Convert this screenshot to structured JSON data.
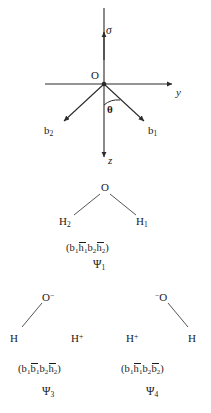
{
  "figure": {
    "title_text": "",
    "stroke_color": "#2b2b2b",
    "text_color": "#1a1a1a",
    "background": "#ffffff"
  },
  "axes_diagram": {
    "origin_label": "O",
    "sigma_label": "σ",
    "y_axis_label": "y",
    "z_axis_label": "z",
    "theta_label": "θ",
    "bond_left_label": "b",
    "bond_left_sub": "2",
    "bond_right_label": "b",
    "bond_right_sub": "1"
  },
  "structure_top": {
    "oxygen_label": "O",
    "h_left_label": "H",
    "h_left_sub": "2",
    "h_right_label": "H",
    "h_right_sub": "1",
    "formula": {
      "open": "(",
      "t1": "b",
      "t1sub": "1",
      "t2": "h",
      "t2sub": "1",
      "t2bar": true,
      "t3": "b",
      "t3sub": "2",
      "t4": "h",
      "t4sub": "2",
      "t4bar": true,
      "close": ")"
    },
    "psi": "Ψ",
    "psi_sub": "1"
  },
  "structure_left": {
    "oxygen_label": "O",
    "oxygen_charge": "−",
    "h_left_label": "H",
    "h_right_label": "H",
    "h_right_charge": "+",
    "formula": {
      "open": "(",
      "t1": "b",
      "t1sub": "1",
      "t2": "b",
      "t2sub": "1",
      "t2bar": true,
      "t3": "b",
      "t3sub": "2",
      "t4": "h",
      "t4sub": "2",
      "t4bar": true,
      "close": ")"
    },
    "psi": "Ψ",
    "psi_sub": "3"
  },
  "structure_right": {
    "oxygen_label": "O",
    "oxygen_charge": "−",
    "h_left_label": "H",
    "h_left_charge": "+",
    "h_right_label": "H",
    "formula": {
      "open": "(",
      "t1": "b",
      "t1sub": "1",
      "t2": "h",
      "t2sub": "1",
      "t2bar": true,
      "t3": "b",
      "t3sub": "2",
      "t4": "b",
      "t4sub": "2",
      "t4bar": true,
      "close": ")"
    },
    "psi": "Ψ",
    "psi_sub": "4"
  }
}
